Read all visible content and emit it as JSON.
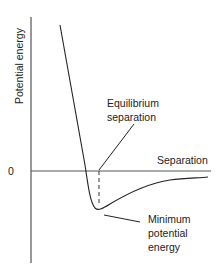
{
  "diagram": {
    "y_axis_label": "Potential energy",
    "x_axis_label": "Separation",
    "zero_label": "0",
    "annotations": {
      "equilibrium_line1": "Equilibrium",
      "equilibrium_line2": "separation",
      "minimum_line1": "Minimum",
      "minimum_line2": "potential",
      "minimum_line3": "energy"
    },
    "colors": {
      "stroke": "#222222",
      "background": "#ffffff"
    }
  }
}
